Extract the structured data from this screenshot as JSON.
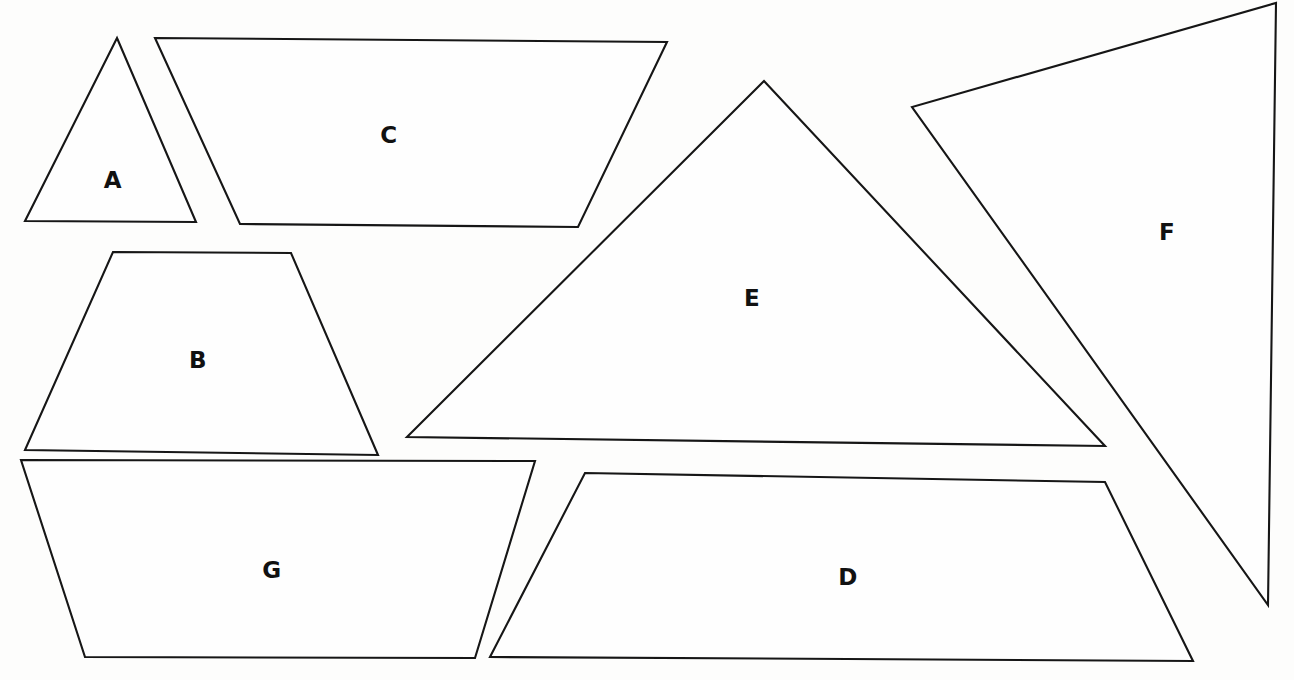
{
  "page": {
    "width": 1294,
    "height": 680,
    "background_color": "#fdfdfc",
    "ink_color": "#161616",
    "header_ghost_text": ""
  },
  "figure": {
    "shape_count": 7,
    "labels": [
      "A",
      "B",
      "C",
      "D",
      "E",
      "F",
      "G"
    ]
  },
  "shapes": [
    {
      "id": "A",
      "label": "A",
      "kind": "triangle",
      "points": "117,38 196,222 25,221",
      "label_x": 113,
      "label_y": 180
    },
    {
      "id": "B",
      "label": "B",
      "kind": "trapezoid",
      "points": "113,252 291,253 378,455 25,450",
      "label_x": 198,
      "label_y": 360
    },
    {
      "id": "C",
      "label": "C",
      "kind": "parallelogram",
      "points": "155,38 667,42 578,227 240,224",
      "label_x": 389,
      "label_y": 135
    },
    {
      "id": "D",
      "label": "D",
      "kind": "parallelogram",
      "points": "585,473 1105,482 1193,661 490,657",
      "label_x": 848,
      "label_y": 577
    },
    {
      "id": "E",
      "label": "E",
      "kind": "triangle",
      "points": "764,81 1105,446 407,437",
      "label_x": 752,
      "label_y": 298
    },
    {
      "id": "F",
      "label": "F",
      "kind": "triangle",
      "points": "1276,3 1268,605 912,107",
      "label_x": 1167,
      "label_y": 232
    },
    {
      "id": "G",
      "label": "G",
      "kind": "trapezoid",
      "points": "21,460 535,461 475,658 85,657",
      "label_x": 272,
      "label_y": 570
    }
  ]
}
